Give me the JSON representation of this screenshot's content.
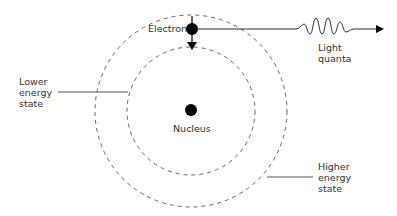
{
  "diagram": {
    "labels": {
      "electron": "Electron",
      "light_quanta_line1": "Light",
      "light_quanta_line2": "quanta",
      "lower_line1": "Lower",
      "lower_line2": "energy",
      "lower_line3": "state",
      "nucleus": "Nucleus",
      "higher_line1": "Higher",
      "higher_line2": "energy",
      "higher_line3": "state"
    },
    "colors": {
      "stroke": "#555555",
      "fill": "#000000",
      "text": "#333333"
    }
  }
}
